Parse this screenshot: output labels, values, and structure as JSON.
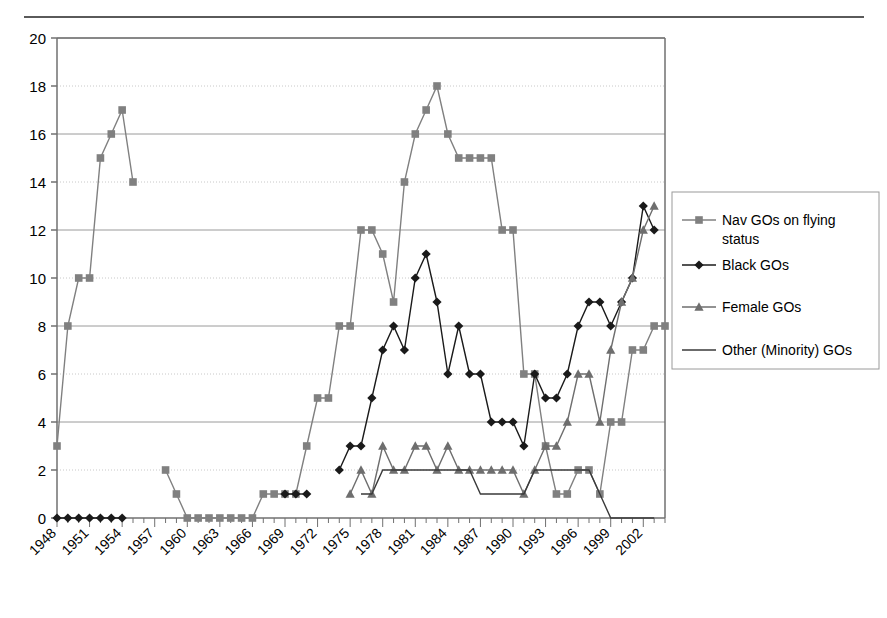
{
  "chart_data": {
    "type": "line",
    "title": "",
    "xlabel": "",
    "ylabel": "",
    "ylim": [
      0,
      20
    ],
    "ytick_step": 2,
    "yticks": [
      0,
      2,
      4,
      6,
      8,
      10,
      12,
      14,
      16,
      18,
      20
    ],
    "xlim": [
      1948,
      2004
    ],
    "xticks": [
      1948,
      1951,
      1954,
      1957,
      1960,
      1963,
      1966,
      1969,
      1972,
      1975,
      1978,
      1981,
      1984,
      1987,
      1990,
      1993,
      1996,
      1999,
      2002
    ],
    "xtick_labels": [
      "1948",
      "1951",
      "1954",
      "1957",
      "1960",
      "1963",
      "1966",
      "1969",
      "1972",
      "1975",
      "1978",
      "1981",
      "1984",
      "1987",
      "1990",
      "1993",
      "1996",
      "1999",
      "2002"
    ],
    "xtick_rotation": -45,
    "x": [
      1948,
      1949,
      1950,
      1951,
      1952,
      1953,
      1954,
      1955,
      1956,
      1957,
      1958,
      1959,
      1960,
      1961,
      1962,
      1963,
      1964,
      1965,
      1966,
      1967,
      1968,
      1969,
      1970,
      1971,
      1972,
      1973,
      1974,
      1975,
      1976,
      1977,
      1978,
      1979,
      1980,
      1981,
      1982,
      1983,
      1984,
      1985,
      1986,
      1987,
      1988,
      1989,
      1990,
      1991,
      1992,
      1993,
      1994,
      1995,
      1996,
      1997,
      1998,
      1999,
      2000,
      2001,
      2002,
      2003,
      2004
    ],
    "grid": {
      "horizontal": true,
      "vertical": false
    },
    "legend_position": "right",
    "series": [
      {
        "name": "Nav GOs on flying status",
        "marker": "square",
        "color": "#808080",
        "line_color": "#808080",
        "values": [
          3,
          8,
          10,
          10,
          15,
          16,
          17,
          14,
          null,
          null,
          2,
          1,
          0,
          0,
          0,
          0,
          0,
          0,
          0,
          1,
          1,
          1,
          1,
          3,
          5,
          5,
          8,
          8,
          12,
          12,
          11,
          9,
          14,
          16,
          17,
          18,
          16,
          15,
          15,
          15,
          15,
          12,
          12,
          6,
          6,
          3,
          1,
          1,
          2,
          2,
          1,
          4,
          4,
          7,
          7,
          8,
          8
        ]
      },
      {
        "name": "Black GOs",
        "marker": "diamond",
        "color": "#1a1a1a",
        "line_color": "#1a1a1a",
        "values": [
          0,
          0,
          0,
          0,
          0,
          0,
          0,
          null,
          null,
          null,
          null,
          null,
          null,
          null,
          null,
          null,
          null,
          null,
          null,
          null,
          null,
          1,
          1,
          1,
          null,
          null,
          2,
          3,
          3,
          5,
          7,
          8,
          7,
          10,
          11,
          9,
          6,
          8,
          6,
          6,
          4,
          4,
          4,
          3,
          6,
          5,
          5,
          6,
          8,
          9,
          9,
          8,
          9,
          10,
          13,
          12,
          null
        ]
      },
      {
        "name": "Female GOs",
        "marker": "triangle",
        "color": "#6e6e6e",
        "line_color": "#6e6e6e",
        "values": [
          null,
          null,
          null,
          null,
          null,
          null,
          null,
          null,
          null,
          null,
          null,
          null,
          null,
          null,
          null,
          null,
          null,
          null,
          null,
          null,
          null,
          null,
          null,
          null,
          null,
          null,
          null,
          1,
          2,
          1,
          3,
          2,
          2,
          3,
          3,
          2,
          3,
          2,
          2,
          2,
          2,
          2,
          2,
          1,
          2,
          3,
          3,
          4,
          6,
          6,
          4,
          7,
          9,
          10,
          12,
          13,
          null
        ]
      },
      {
        "name": "Other (Minority) GOs",
        "marker": "none",
        "color": "#3a3a3a",
        "line_color": "#3a3a3a",
        "values": [
          null,
          null,
          null,
          null,
          null,
          null,
          null,
          null,
          null,
          null,
          null,
          null,
          null,
          null,
          null,
          null,
          null,
          null,
          null,
          null,
          null,
          null,
          null,
          null,
          null,
          null,
          null,
          null,
          1,
          1,
          2,
          2,
          2,
          2,
          2,
          2,
          2,
          2,
          2,
          1,
          1,
          1,
          1,
          1,
          2,
          2,
          2,
          2,
          2,
          2,
          1,
          0,
          0,
          0,
          0,
          0,
          null
        ]
      }
    ]
  },
  "legend": {
    "entries": [
      {
        "label": "Nav GOs on flying status"
      },
      {
        "label": "Black GOs"
      },
      {
        "label": "Female GOs"
      },
      {
        "label": "Other (Minority) GOs"
      }
    ]
  }
}
